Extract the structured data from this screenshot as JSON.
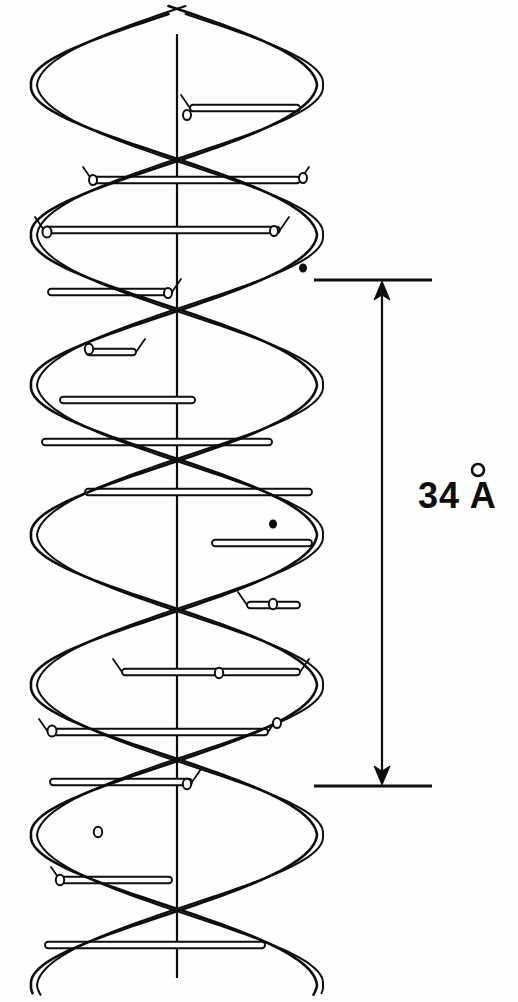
{
  "figure": {
    "background_color": "#fefefe",
    "ink_color": "#0d0d0d",
    "width": 518,
    "height": 1002
  },
  "annotation": {
    "measurement_value": "34",
    "unit_symbol": "A",
    "label_text": "34 Å",
    "label_x": 418,
    "label_y": 508,
    "ring_cx": 478,
    "ring_cy": 470,
    "ring_r": 6
  },
  "dimension": {
    "top_tick_y": 280,
    "bottom_tick_y": 786,
    "tick_x_start": 314,
    "tick_x_end": 432,
    "shaft_x": 382,
    "arrow_size": 11
  },
  "axis": {
    "x": 177,
    "y_top": 34,
    "y_bottom": 978
  },
  "helix": {
    "center_x": 177,
    "amplitude": 143,
    "pitch": 300,
    "phase_offset_deg": 180,
    "ribbon_width": 17,
    "turn_count": 3.3,
    "y_start": 10,
    "y_end": 995
  },
  "chart_data": {
    "type": "diagram",
    "annotations": [
      {
        "label": "34 Å",
        "kind": "pitch-dimension",
        "value": 34,
        "unit": "Å"
      }
    ],
    "rungs": [
      {
        "index": 1,
        "y": 108,
        "x_left": 190,
        "x_right": 300,
        "cap_left": "node",
        "cap_right": "flat"
      },
      {
        "index": 2,
        "y": 180,
        "x_left": 92,
        "x_right": 300,
        "cap_left": "node",
        "cap_right": "node"
      },
      {
        "index": 3,
        "y": 230,
        "x_left": 44,
        "x_right": 280,
        "cap_left": "node",
        "cap_right": "node"
      },
      {
        "index": 4,
        "y": 292,
        "x_left": 48,
        "x_right": 172,
        "cap_left": "flat",
        "cap_right": "node"
      },
      {
        "index": 5,
        "y": 352,
        "x_left": 86,
        "x_right": 136,
        "cap_left": "flat",
        "cap_right": "node"
      },
      {
        "index": 6,
        "y": 400,
        "x_left": 60,
        "x_right": 195,
        "cap_left": "flat",
        "cap_right": "flat"
      },
      {
        "index": 7,
        "y": 442,
        "x_left": 42,
        "x_right": 272,
        "cap_left": "flat",
        "cap_right": "flat"
      },
      {
        "index": 8,
        "y": 492,
        "x_left": 85,
        "x_right": 312,
        "cap_left": "flat",
        "cap_right": "flat"
      },
      {
        "index": 9,
        "y": 543,
        "x_left": 212,
        "x_right": 312,
        "cap_left": "flat",
        "cap_right": "flat"
      },
      {
        "index": 10,
        "y": 605,
        "x_left": 247,
        "x_right": 300,
        "cap_left": "node",
        "cap_right": "flat"
      },
      {
        "index": 11,
        "y": 672,
        "x_left": 122,
        "x_right": 300,
        "cap_left": "node",
        "cap_right": "node"
      },
      {
        "index": 12,
        "y": 732,
        "x_left": 48,
        "x_right": 268,
        "cap_left": "node",
        "cap_right": "node"
      },
      {
        "index": 13,
        "y": 782,
        "x_left": 50,
        "x_right": 192,
        "cap_left": "flat",
        "cap_right": "node"
      },
      {
        "index": 14,
        "y": 880,
        "x_left": 60,
        "x_right": 172,
        "cap_left": "node",
        "cap_right": "flat"
      },
      {
        "index": 15,
        "y": 945,
        "x_left": 45,
        "x_right": 265,
        "cap_left": "flat",
        "cap_right": "flat"
      }
    ],
    "nodes": [
      {
        "cx": 187,
        "cy": 115,
        "rx": 4.0,
        "ry": 5.0,
        "style": "open"
      },
      {
        "cx": 93,
        "cy": 180,
        "rx": 4.0,
        "ry": 5.0,
        "style": "open"
      },
      {
        "cx": 303,
        "cy": 178,
        "rx": 4.0,
        "ry": 5.0,
        "style": "open"
      },
      {
        "cx": 47,
        "cy": 232,
        "rx": 4.5,
        "ry": 5.5,
        "style": "open"
      },
      {
        "cx": 274,
        "cy": 231,
        "rx": 4.0,
        "ry": 5.0,
        "style": "open"
      },
      {
        "cx": 168,
        "cy": 293,
        "rx": 4.0,
        "ry": 5.0,
        "style": "open"
      },
      {
        "cx": 89,
        "cy": 349,
        "rx": 4.2,
        "ry": 5.2,
        "style": "open"
      },
      {
        "cx": 273,
        "cy": 604,
        "rx": 4.2,
        "ry": 5.2,
        "style": "open"
      },
      {
        "cx": 277,
        "cy": 612,
        "rx": 0.0,
        "ry": 0.0,
        "style": "none"
      },
      {
        "cx": 219,
        "cy": 673,
        "rx": 4.2,
        "ry": 5.2,
        "style": "open"
      },
      {
        "cx": 52,
        "cy": 731,
        "rx": 4.5,
        "ry": 5.5,
        "style": "open"
      },
      {
        "cx": 277,
        "cy": 723,
        "rx": 4.0,
        "ry": 5.0,
        "style": "open"
      },
      {
        "cx": 187,
        "cy": 784,
        "rx": 4.2,
        "ry": 5.2,
        "style": "open"
      },
      {
        "cx": 98,
        "cy": 832,
        "rx": 4.2,
        "ry": 5.2,
        "style": "open"
      },
      {
        "cx": 60,
        "cy": 880,
        "rx": 4.2,
        "ry": 5.2,
        "style": "open"
      },
      {
        "cx": 273,
        "cy": 524,
        "rx": 3.2,
        "ry": 3.8,
        "style": "filled"
      },
      {
        "cx": 303,
        "cy": 268,
        "rx": 3.2,
        "ry": 3.8,
        "style": "filled"
      }
    ]
  }
}
